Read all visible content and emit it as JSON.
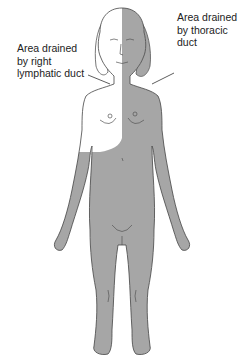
{
  "labels": {
    "right_lymphatic": {
      "lines": [
        "Area drained",
        "by right",
        "lymphatic duct"
      ]
    },
    "thoracic": {
      "lines": [
        "Area drained",
        "by thoracic",
        "duct"
      ]
    }
  },
  "colors": {
    "shaded_region": "#a6a6a6",
    "unshaded_region": "#ffffff",
    "outline": "#444444",
    "text": "#222222"
  }
}
